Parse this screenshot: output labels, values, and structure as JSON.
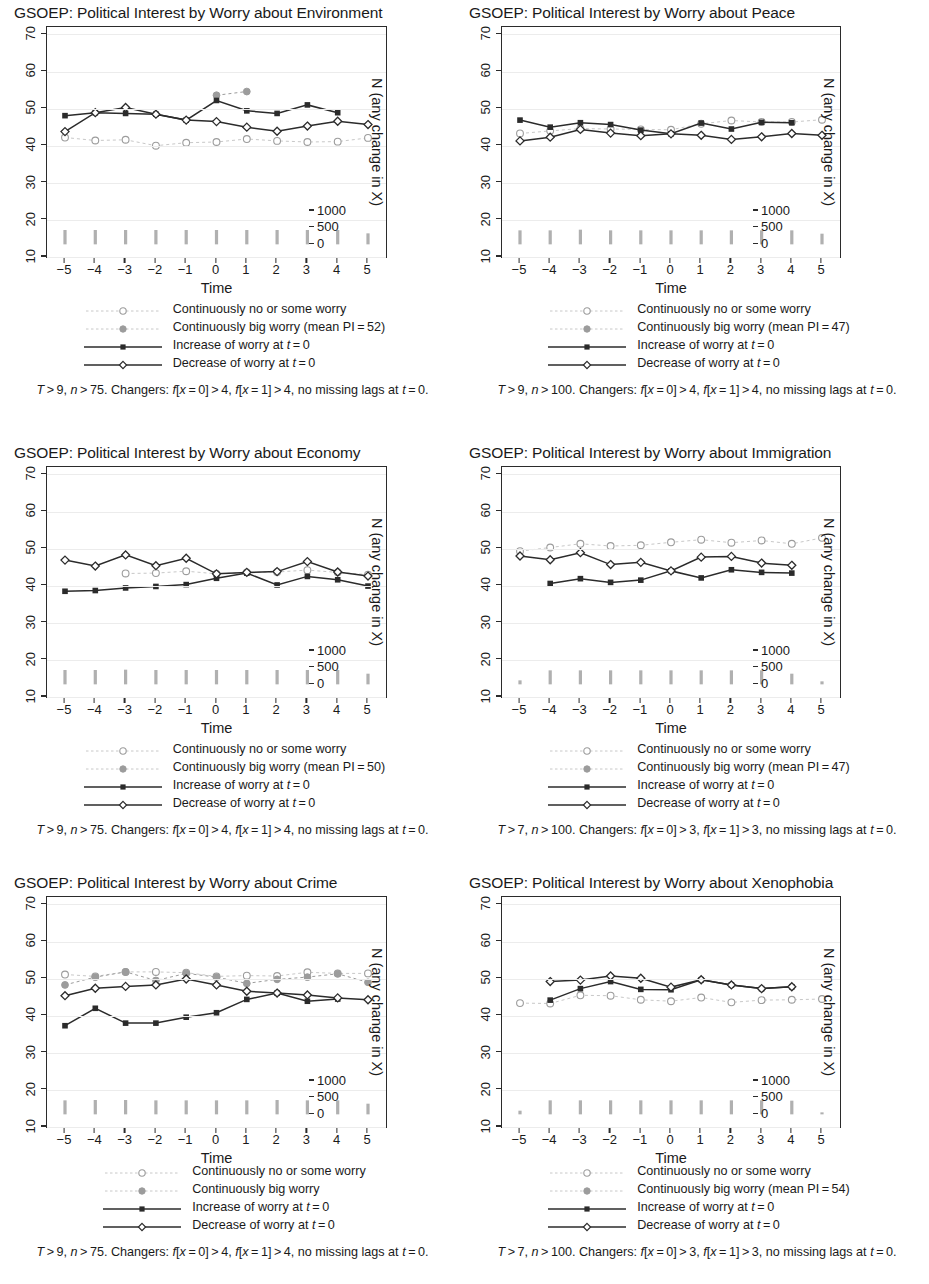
{
  "figure": {
    "shared": {
      "xlabel": "Time",
      "right_axis_title": "N (any change in X)",
      "y_ticks": [
        10,
        20,
        30,
        40,
        50,
        60,
        70
      ],
      "x_ticks": [
        "−5",
        "−4",
        "−3",
        "−2",
        "−1",
        "0",
        "1",
        "2",
        "3",
        "4",
        "5"
      ],
      "right_ticks": [
        0,
        500,
        1000
      ],
      "ylim": [
        10,
        72
      ],
      "xlim": [
        -5,
        5
      ],
      "right_ylim": [
        0,
        1000
      ],
      "colors": {
        "dark": "#2b2b2b",
        "gray": "#9c9c9c",
        "light_gray": "#c8c8c8",
        "gridline": "#ececec",
        "bar": "#b0b0b0"
      }
    },
    "panels": [
      {
        "id": "environment",
        "title": "GSOEP: Political Interest by Worry about Environment",
        "legend": [
          {
            "key": "dotted-open-circle",
            "label": "Continuously no or some worry"
          },
          {
            "key": "dotted-filled-circle",
            "label": "Continuously big worry (mean PI = 52)"
          },
          {
            "key": "solid-filled-square",
            "label": "Increase of worry at t = 0"
          },
          {
            "key": "solid-open-diamond",
            "label": "Decrease of worry at t = 0"
          }
        ],
        "caption": "T > 9, n > 75. Changers: f[x = 0] > 4, f[x = 1] > 4, no missing lags at t = 0.",
        "chart_data": {
          "type": "line",
          "x": [
            -5,
            -4,
            -3,
            -2,
            -1,
            0,
            1,
            2,
            3,
            4,
            5
          ],
          "series": [
            {
              "name": "Continuously no or some worry",
              "style": "dotted-open-circle",
              "values": [
                42.2,
                41.4,
                41.6,
                40.0,
                40.8,
                41.0,
                41.8,
                41.3,
                41.0,
                41.1,
                42.1
              ]
            },
            {
              "name": "Continuously big worry",
              "style": "dotted-filled-circle",
              "values": [
                null,
                null,
                null,
                null,
                null,
                53.6,
                54.6,
                null,
                null,
                null,
                null
              ]
            },
            {
              "name": "Increase of worry at t=0",
              "style": "solid-filled-square",
              "values": [
                48.1,
                48.9,
                48.7,
                48.5,
                46.9,
                52.2,
                49.4,
                48.7,
                51.0,
                48.9,
                null
              ]
            },
            {
              "name": "Decrease of worry at t=0",
              "style": "solid-open-diamond",
              "values": [
                43.8,
                48.9,
                50.3,
                48.5,
                46.9,
                46.5,
                45.0,
                43.9,
                45.3,
                46.6,
                45.7
              ]
            }
          ],
          "bars": {
            "name": "N (any change in X)",
            "values": [
              430,
              430,
              430,
              430,
              430,
              430,
              430,
              430,
              430,
              430,
              330
            ]
          }
        }
      },
      {
        "id": "peace",
        "title": "GSOEP: Political Interest by Worry about Peace",
        "legend": [
          {
            "key": "dotted-open-circle",
            "label": "Continuously no or some worry"
          },
          {
            "key": "dotted-filled-circle",
            "label": "Continuously big worry (mean PI = 47)"
          },
          {
            "key": "solid-filled-square",
            "label": "Increase of worry at t = 0"
          },
          {
            "key": "solid-open-diamond",
            "label": "Decrease of worry at t = 0"
          }
        ],
        "caption": "T > 9, n > 100. Changers: f[x = 0] > 4, f[x = 1] > 4, no missing lags at t = 0.",
        "chart_data": {
          "type": "line",
          "x": [
            -5,
            -4,
            -3,
            -2,
            -1,
            0,
            1,
            2,
            3,
            4,
            5
          ],
          "series": [
            {
              "name": "Continuously no or some worry",
              "style": "dotted-open-circle",
              "values": [
                43.3,
                44.0,
                44.6,
                44.5,
                44.4,
                44.3,
                45.9,
                46.8,
                46.4,
                46.4,
                47.0
              ]
            },
            {
              "name": "Continuously big worry",
              "style": "dotted-filled-circle",
              "values": [
                null,
                null,
                null,
                null,
                null,
                null,
                null,
                null,
                null,
                null,
                null
              ]
            },
            {
              "name": "Increase of worry at t=0",
              "style": "solid-filled-square",
              "values": [
                46.9,
                45.0,
                46.2,
                45.7,
                44.2,
                43.2,
                46.1,
                44.5,
                46.3,
                46.2,
                null
              ]
            },
            {
              "name": "Decrease of worry at t=0",
              "style": "solid-open-diamond",
              "values": [
                41.3,
                42.3,
                44.4,
                43.4,
                42.7,
                43.2,
                42.8,
                41.7,
                42.4,
                43.3,
                42.8
              ]
            }
          ],
          "bars": {
            "name": "N (any change in X)",
            "values": [
              420,
              420,
              440,
              420,
              420,
              420,
              420,
              420,
              420,
              420,
              320
            ]
          }
        }
      },
      {
        "id": "economy",
        "title": "GSOEP: Political Interest by Worry about Economy",
        "legend": [
          {
            "key": "dotted-open-circle",
            "label": "Continuously no or some worry"
          },
          {
            "key": "dotted-filled-circle",
            "label": "Continuously big worry (mean PI = 50)"
          },
          {
            "key": "solid-filled-square",
            "label": "Increase of worry at t = 0"
          },
          {
            "key": "solid-open-diamond",
            "label": "Decrease of worry at t = 0"
          }
        ],
        "caption": "T > 9, n > 75. Changers: f[x = 0] > 4, f[x = 1] > 4, no missing lags at t = 0.",
        "chart_data": {
          "type": "line",
          "x": [
            -5,
            -4,
            -3,
            -2,
            -1,
            0,
            1,
            2,
            3,
            4,
            5
          ],
          "series": [
            {
              "name": "Continuously no or some worry",
              "style": "dotted-open-circle",
              "values": [
                null,
                null,
                43.3,
                43.4,
                43.9,
                43.2,
                43.6,
                43.7,
                44.2,
                43.6,
                43.0
              ]
            },
            {
              "name": "Continuously big worry",
              "style": "dotted-filled-circle",
              "values": [
                null,
                null,
                null,
                null,
                null,
                43.2,
                null,
                null,
                null,
                null,
                null
              ]
            },
            {
              "name": "Increase of worry at t=0",
              "style": "solid-filled-square",
              "values": [
                38.5,
                38.7,
                39.4,
                39.8,
                40.3,
                42.0,
                43.4,
                40.2,
                42.5,
                41.6,
                39.9
              ]
            },
            {
              "name": "Decrease of worry at t=0",
              "style": "solid-open-diamond",
              "values": [
                46.9,
                45.3,
                48.3,
                45.4,
                47.4,
                43.2,
                43.6,
                43.8,
                46.5,
                43.7,
                42.6
              ]
            }
          ],
          "bars": {
            "name": "N (any change in X)",
            "values": [
              430,
              430,
              440,
              430,
              430,
              430,
              430,
              430,
              430,
              430,
              320
            ]
          }
        }
      },
      {
        "id": "immigration",
        "title": "GSOEP: Political Interest by Worry about Immigration",
        "legend": [
          {
            "key": "dotted-open-circle",
            "label": "Continuously no or some worry"
          },
          {
            "key": "dotted-filled-circle",
            "label": "Continuously big worry (mean PI = 47)"
          },
          {
            "key": "solid-filled-square",
            "label": "Increase of worry at t = 0"
          },
          {
            "key": "solid-open-diamond",
            "label": "Decrease of worry at t = 0"
          }
        ],
        "caption": "T > 7, n > 100. Changers: f[x = 0] > 3, f[x = 1] > 3, no missing lags at t = 0.",
        "chart_data": {
          "type": "line",
          "x": [
            -5,
            -4,
            -3,
            -2,
            -1,
            0,
            1,
            2,
            3,
            4,
            5
          ],
          "series": [
            {
              "name": "Continuously no or some worry",
              "style": "dotted-open-circle",
              "values": [
                49.3,
                50.3,
                51.3,
                50.7,
                50.9,
                51.7,
                52.4,
                51.6,
                52.2,
                51.3,
                52.9
              ]
            },
            {
              "name": "Continuously big worry",
              "style": "dotted-filled-circle",
              "values": [
                null,
                null,
                null,
                null,
                null,
                null,
                null,
                null,
                null,
                null,
                null
              ]
            },
            {
              "name": "Increase of worry at t=0",
              "style": "solid-filled-square",
              "values": [
                null,
                40.6,
                41.9,
                40.9,
                41.5,
                44.0,
                42.1,
                44.3,
                43.6,
                43.4,
                null
              ]
            },
            {
              "name": "Decrease of worry at t=0",
              "style": "solid-open-diamond",
              "values": [
                48.0,
                47.0,
                48.9,
                45.7,
                46.3,
                44.0,
                47.7,
                47.9,
                46.1,
                45.5,
                null
              ]
            }
          ],
          "bars": {
            "name": "N (any change in X)",
            "values": [
              120,
              420,
              420,
              420,
              420,
              420,
              420,
              420,
              420,
              320,
              90
            ]
          }
        }
      },
      {
        "id": "crime",
        "title": "GSOEP: Political Interest by Worry about Crime",
        "legend": [
          {
            "key": "dotted-open-circle",
            "label": "Continuously no or some worry"
          },
          {
            "key": "dotted-filled-circle",
            "label": "Continuously big worry"
          },
          {
            "key": "solid-filled-square",
            "label": "Increase of worry at t = 0"
          },
          {
            "key": "solid-open-diamond",
            "label": "Decrease of worry at t = 0"
          }
        ],
        "caption": "T > 9, n > 75. Changers: f[x = 0] > 4, f[x = 1] > 4, no missing lags at t = 0.",
        "chart_data": {
          "type": "line",
          "x": [
            -5,
            -4,
            -3,
            -2,
            -1,
            0,
            1,
            2,
            3,
            4,
            5
          ],
          "series": [
            {
              "name": "Continuously no or some worry",
              "style": "dotted-open-circle",
              "values": [
                51.1,
                50.6,
                51.8,
                51.8,
                51.6,
                50.6,
                50.8,
                50.7,
                51.7,
                51.4,
                51.4
              ]
            },
            {
              "name": "Continuously big worry",
              "style": "dotted-filled-circle",
              "values": [
                48.3,
                50.4,
                51.8,
                49.5,
                51.4,
                50.4,
                48.7,
                49.8,
                50.4,
                51.3,
                49.0
              ]
            },
            {
              "name": "Increase of worry at t=0",
              "style": "solid-filled-square",
              "values": [
                37.3,
                42.0,
                38.0,
                38.0,
                39.6,
                40.8,
                44.4,
                46.1,
                43.9,
                44.5,
                null
              ]
            },
            {
              "name": "Decrease of worry at t=0",
              "style": "solid-open-diamond",
              "values": [
                45.4,
                47.4,
                47.9,
                48.3,
                49.9,
                48.3,
                46.6,
                46.1,
                45.6,
                44.8,
                44.3
              ]
            }
          ],
          "bars": {
            "name": "N (any change in X)",
            "values": [
              420,
              430,
              430,
              420,
              420,
              420,
              420,
              430,
              420,
              420,
              320
            ]
          }
        }
      },
      {
        "id": "xenophobia",
        "title": "GSOEP: Political Interest by Worry about Xenophobia",
        "legend": [
          {
            "key": "dotted-open-circle",
            "label": "Continuously no or some worry"
          },
          {
            "key": "dotted-filled-circle",
            "label": "Continuously big worry (mean PI = 54)"
          },
          {
            "key": "solid-filled-square",
            "label": "Increase of worry at t = 0"
          },
          {
            "key": "solid-open-diamond",
            "label": "Decrease of worry at t = 0"
          }
        ],
        "caption": "T > 7, n > 100. Changers: f[x = 0] > 3, f[x = 1] > 3, no missing lags at t = 0.",
        "chart_data": {
          "type": "line",
          "x": [
            -5,
            -4,
            -3,
            -2,
            -1,
            0,
            1,
            2,
            3,
            4,
            5
          ],
          "series": [
            {
              "name": "Continuously no or some worry",
              "style": "dotted-open-circle",
              "values": [
                43.4,
                43.3,
                45.5,
                45.4,
                44.3,
                43.9,
                44.9,
                43.6,
                44.2,
                44.3,
                44.5
              ]
            },
            {
              "name": "Continuously big worry",
              "style": "dotted-filled-circle",
              "values": [
                null,
                null,
                null,
                null,
                null,
                null,
                null,
                null,
                null,
                null,
                null
              ]
            },
            {
              "name": "Increase of worry at t=0",
              "style": "solid-filled-square",
              "values": [
                null,
                44.2,
                47.3,
                49.2,
                47.1,
                47.0,
                49.7,
                48.3,
                47.3,
                47.8,
                null
              ]
            },
            {
              "name": "Decrease of worry at t=0",
              "style": "solid-open-diamond",
              "values": [
                null,
                49.2,
                49.6,
                50.7,
                50.1,
                47.7,
                49.7,
                48.3,
                47.3,
                47.8,
                null
              ]
            }
          ],
          "bars": {
            "name": "N (any change in X)",
            "values": [
              110,
              420,
              420,
              420,
              420,
              420,
              420,
              420,
              420,
              410,
              60
            ]
          }
        }
      }
    ]
  }
}
